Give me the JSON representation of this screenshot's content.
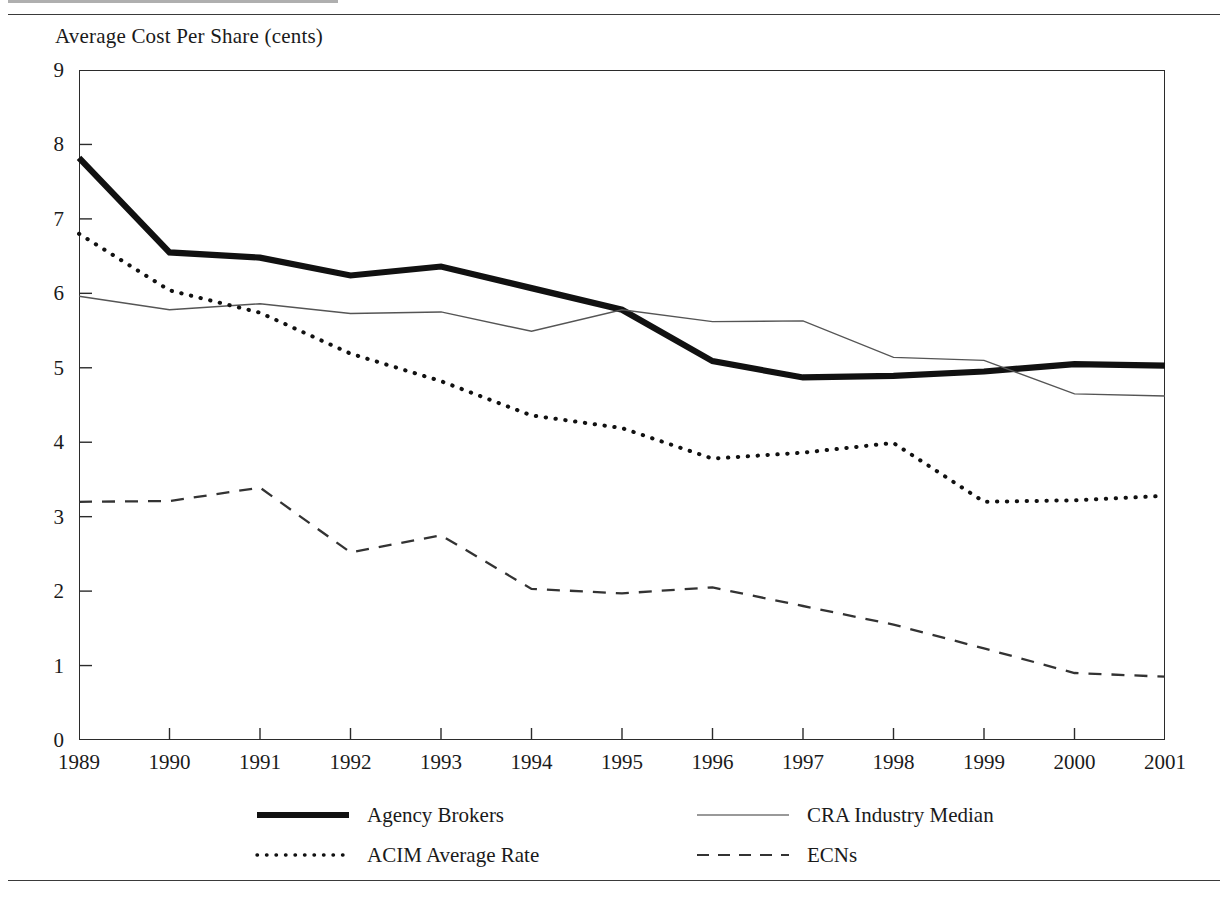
{
  "figure": {
    "axis_title": "Average Cost Per Share (cents)"
  },
  "chart_data": {
    "type": "line",
    "title": "Average Cost Per Share (cents)",
    "xlabel": "",
    "ylabel": "Average Cost Per Share (cents)",
    "xlim": [
      1989,
      2001
    ],
    "ylim": [
      0,
      9
    ],
    "grid": false,
    "legend_position": "bottom",
    "categories": [
      "1989",
      "1990",
      "1991",
      "1992",
      "1993",
      "1994",
      "1995",
      "1996",
      "1997",
      "1998",
      "1999",
      "2000",
      "2001"
    ],
    "x": [
      1989,
      1990,
      1991,
      1992,
      1993,
      1994,
      1995,
      1996,
      1997,
      1998,
      1999,
      2000,
      2001
    ],
    "yticks": [
      "0",
      "1",
      "2",
      "3",
      "4",
      "5",
      "6",
      "7",
      "8",
      "9"
    ],
    "series": [
      {
        "name": "Agency Brokers",
        "style": "thick-solid",
        "color": "#111111",
        "values": [
          7.82,
          6.55,
          6.48,
          6.24,
          6.36,
          6.07,
          5.78,
          5.09,
          4.87,
          4.89,
          4.95,
          5.05,
          5.03
        ]
      },
      {
        "name": "CRA Industry Median",
        "style": "thin-solid",
        "color": "#555555",
        "values": [
          5.96,
          5.78,
          5.86,
          5.73,
          5.75,
          5.49,
          5.78,
          5.62,
          5.63,
          5.14,
          5.1,
          4.65,
          4.62
        ]
      },
      {
        "name": "ACIM Average Rate",
        "style": "dotted",
        "color": "#111111",
        "values": [
          6.8,
          6.04,
          5.74,
          5.19,
          4.82,
          4.36,
          4.19,
          3.78,
          3.86,
          3.99,
          3.2,
          3.22,
          3.28
        ]
      },
      {
        "name": "ECNs",
        "style": "dashed",
        "color": "#333333",
        "values": [
          3.2,
          3.21,
          3.39,
          2.52,
          2.75,
          2.03,
          1.97,
          2.05,
          1.8,
          1.55,
          1.23,
          0.9,
          0.85
        ]
      }
    ]
  },
  "legend": {
    "entries": [
      {
        "label": "Agency Brokers",
        "sample": "thick-solid-line-sample"
      },
      {
        "label": "ACIM Average Rate",
        "sample": "dotted-line-sample"
      },
      {
        "label": "CRA Industry Median",
        "sample": "thin-solid-line-sample"
      },
      {
        "label": "ECNs",
        "sample": "dashed-line-sample"
      }
    ]
  }
}
